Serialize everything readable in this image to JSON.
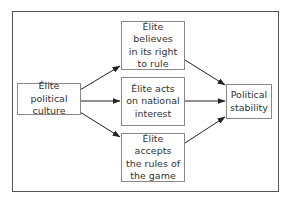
{
  "diagram": {
    "type": "flow",
    "nodes": {
      "source": {
        "id": "elite-political-culture",
        "label": "Élite political\nculture"
      },
      "middle": [
        {
          "id": "belief-right-to-rule",
          "label": "Élite believes\nin its right\nto rule"
        },
        {
          "id": "national-interest",
          "label": "Élite acts\non national\ninterest"
        },
        {
          "id": "accepts-rules",
          "label": "Élite accepts\nthe rules of\nthe game"
        }
      ],
      "target": {
        "id": "political-stability",
        "label": "Political\nstability"
      }
    },
    "edges": [
      {
        "from": "elite-political-culture",
        "to": "belief-right-to-rule"
      },
      {
        "from": "elite-political-culture",
        "to": "national-interest"
      },
      {
        "from": "elite-political-culture",
        "to": "accepts-rules"
      },
      {
        "from": "belief-right-to-rule",
        "to": "political-stability"
      },
      {
        "from": "national-interest",
        "to": "political-stability"
      },
      {
        "from": "accepts-rules",
        "to": "political-stability"
      }
    ],
    "colors": {
      "border": "#888888",
      "frame": "#555555",
      "arrow": "#222222",
      "text": "#333333"
    }
  }
}
